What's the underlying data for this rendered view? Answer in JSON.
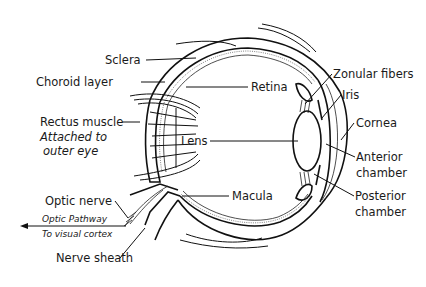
{
  "diagram": {
    "type": "anatomical-cross-section",
    "labels": {
      "sclera": "Sclera",
      "choroid": "Choroid layer",
      "retina": "Retina",
      "rectus_muscle": "Rectus muscle",
      "rectus_note_1": "Attached to",
      "rectus_note_2": "outer eye",
      "optic_nerve": "Optic nerve",
      "optic_pathway": "Optic Pathway",
      "visual_cortex": "To visual cortex",
      "nerve_sheath": "Nerve sheath",
      "lens": "Lens",
      "macula": "Macula",
      "zonular_fibers": "Zonular fibers",
      "iris": "Iris",
      "cornea": "Cornea",
      "anterior_1": "Anterior",
      "anterior_2": "chamber",
      "posterior_1": "Posterior",
      "posterior_2": "chamber"
    },
    "colors": {
      "ink": "#111111",
      "background": "#ffffff"
    }
  }
}
